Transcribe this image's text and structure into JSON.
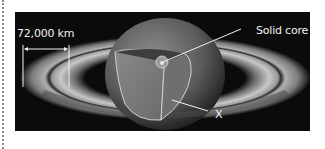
{
  "diagram": {
    "labels": {
      "scale": "72,000 km",
      "core": "Solid core",
      "unknown_layer": "X"
    },
    "colors": {
      "background": "#0b0b0b",
      "label_text": "#f2f2f2",
      "ring_light": "#bdbdbd",
      "ring_dark": "#3a3a3a",
      "cutaway_face": "#7a7a7a",
      "cutaway_shadow": "#5a5a5a",
      "core": "#cfcfcf"
    }
  }
}
